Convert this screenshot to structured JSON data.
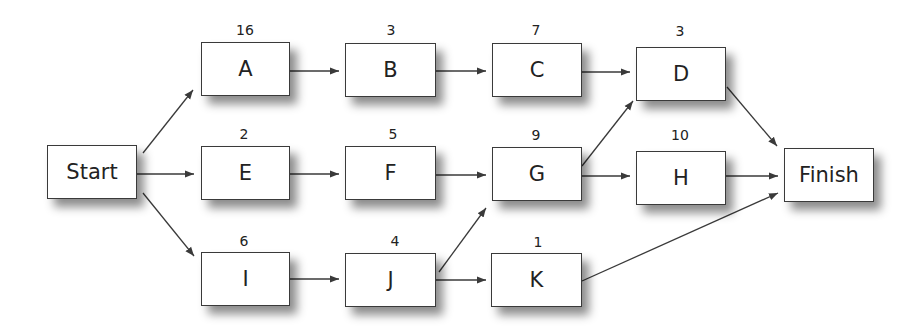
{
  "diagram": {
    "type": "activity-on-node network",
    "nodes": [
      {
        "id": "start",
        "label": "Start",
        "duration": null,
        "x": 47,
        "y": 145,
        "w": 90,
        "h": 54
      },
      {
        "id": "A",
        "label": "A",
        "duration": "16",
        "x": 201,
        "y": 42,
        "w": 89,
        "h": 54
      },
      {
        "id": "B",
        "label": "B",
        "duration": "3",
        "x": 345,
        "y": 43,
        "w": 91,
        "h": 54
      },
      {
        "id": "C",
        "label": "C",
        "duration": "7",
        "x": 492,
        "y": 43,
        "w": 90,
        "h": 54
      },
      {
        "id": "D",
        "label": "D",
        "duration": "3",
        "x": 636,
        "y": 47,
        "w": 90,
        "h": 54
      },
      {
        "id": "E",
        "label": "E",
        "duration": "2",
        "x": 201,
        "y": 146,
        "w": 89,
        "h": 54
      },
      {
        "id": "F",
        "label": "F",
        "duration": "5",
        "x": 345,
        "y": 146,
        "w": 91,
        "h": 54
      },
      {
        "id": "G",
        "label": "G",
        "duration": "9",
        "x": 492,
        "y": 147,
        "w": 90,
        "h": 54
      },
      {
        "id": "H",
        "label": "H",
        "duration": "10",
        "x": 636,
        "y": 151,
        "w": 90,
        "h": 54
      },
      {
        "id": "I",
        "label": "I",
        "duration": "6",
        "x": 201,
        "y": 252,
        "w": 89,
        "h": 54
      },
      {
        "id": "J",
        "label": "J",
        "duration": "4",
        "x": 345,
        "y": 253,
        "w": 91,
        "h": 54
      },
      {
        "id": "K",
        "label": "K",
        "duration": "1",
        "x": 491,
        "y": 253,
        "w": 91,
        "h": 54
      },
      {
        "id": "finish",
        "label": "Finish",
        "duration": null,
        "x": 784,
        "y": 148,
        "w": 90,
        "h": 54
      }
    ],
    "edges": [
      {
        "from": "start",
        "to": "A"
      },
      {
        "from": "start",
        "to": "E"
      },
      {
        "from": "start",
        "to": "I"
      },
      {
        "from": "A",
        "to": "B"
      },
      {
        "from": "B",
        "to": "C"
      },
      {
        "from": "C",
        "to": "D"
      },
      {
        "from": "D",
        "to": "finish"
      },
      {
        "from": "E",
        "to": "F"
      },
      {
        "from": "F",
        "to": "G"
      },
      {
        "from": "G",
        "to": "D"
      },
      {
        "from": "G",
        "to": "H"
      },
      {
        "from": "H",
        "to": "finish"
      },
      {
        "from": "I",
        "to": "J"
      },
      {
        "from": "J",
        "to": "G"
      },
      {
        "from": "J",
        "to": "K"
      },
      {
        "from": "K",
        "to": "finish"
      }
    ],
    "colors": {
      "stroke": "#3a3a3a",
      "text": "#222222",
      "background": "#ffffff"
    }
  }
}
